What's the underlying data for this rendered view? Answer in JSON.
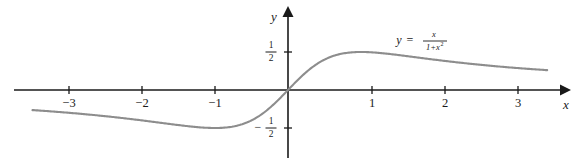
{
  "figure": {
    "background_color": "#ffffff",
    "curve_color": "#8d8d8d",
    "axis_color": "#1a1a1a",
    "xlabel": "x",
    "ylabel": "y"
  },
  "equation": {
    "lhs": "y",
    "equals": "=",
    "numerator": "x",
    "denominator_base": "1+x",
    "denominator_exponent": "2",
    "full_text": "y = x/(1+x^2)"
  },
  "axes": {
    "x_ticks": [
      {
        "value": -3,
        "label": "−3"
      },
      {
        "value": -2,
        "label": "−2"
      },
      {
        "value": -1,
        "label": "−1"
      },
      {
        "value": 1,
        "label": "1"
      },
      {
        "value": 2,
        "label": "2"
      },
      {
        "value": 3,
        "label": "3"
      }
    ],
    "y_ticks": [
      {
        "value": 0.5,
        "sign": "",
        "numerator": "1",
        "denominator": "2",
        "label": "1/2"
      },
      {
        "value": -0.5,
        "sign": "−",
        "numerator": "1",
        "denominator": "2",
        "label": "-1/2"
      }
    ]
  },
  "chart_data": {
    "type": "line",
    "title": "",
    "xlabel": "x",
    "ylabel": "y",
    "legend": [
      "y = x/(1+x^2)"
    ],
    "grid": false,
    "xlim": [
      -3.5,
      3.55
    ],
    "ylim": [
      -0.9,
      0.97
    ],
    "function": "y = x / (1 + x^2)",
    "annotations": [
      {
        "text": "y = x/(1+x^2)",
        "x": 2.2,
        "y": 0.62
      }
    ],
    "x": [
      -3.5,
      -3.25,
      -3.0,
      -2.75,
      -2.5,
      -2.25,
      -2.0,
      -1.75,
      -1.5,
      -1.25,
      -1.0,
      -0.75,
      -0.5,
      -0.25,
      0.0,
      0.25,
      0.5,
      0.75,
      1.0,
      1.25,
      1.5,
      1.75,
      2.0,
      2.25,
      2.5,
      2.75,
      3.0,
      3.25,
      3.5
    ],
    "y": [
      -0.2697,
      -0.2837,
      -0.3,
      -0.3188,
      -0.3404,
      -0.3652,
      -0.4,
      -0.4255,
      -0.4615,
      -0.4878,
      -0.5,
      -0.48,
      -0.4,
      -0.2353,
      0.0,
      0.2353,
      0.4,
      0.48,
      0.5,
      0.4878,
      0.4615,
      0.4255,
      0.4,
      0.3652,
      0.3404,
      0.3188,
      0.3,
      0.2837,
      0.2697
    ],
    "key_points": [
      {
        "name": "minimum",
        "x": -1,
        "y": -0.5
      },
      {
        "name": "origin",
        "x": 0,
        "y": 0
      },
      {
        "name": "maximum",
        "x": 1,
        "y": 0.5
      }
    ]
  }
}
